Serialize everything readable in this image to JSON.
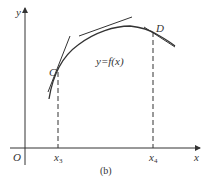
{
  "figure": {
    "caption": "(b)",
    "axes": {
      "x_label": "x",
      "y_label": "y",
      "origin_label": "O"
    },
    "curve_label": "y=f(x)",
    "points": [
      {
        "name": "C",
        "x_tick": "x",
        "x_tick_sub": "3"
      },
      {
        "name": "D",
        "x_tick": "x",
        "x_tick_sub": "4"
      }
    ]
  }
}
